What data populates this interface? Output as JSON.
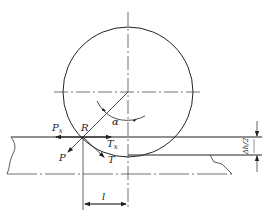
{
  "diagram": {
    "type": "rolling mill deformation zone force diagram",
    "labels": {
      "P_x_main": "P",
      "P_x_sub": "x",
      "R": "R",
      "alpha": "α",
      "T_x_main": "T",
      "T_x_sub": "x",
      "P": "P",
      "T": "T",
      "l": "l",
      "delta_h_over_2": "Δh/2"
    },
    "elements": [
      "roll-circle",
      "roll-centerlines",
      "strip-entry-surface",
      "strip-exit-surface",
      "strip-centerline",
      "force-arrows",
      "contact-length-dimension",
      "reduction-dimension"
    ],
    "colors": {
      "line": "#222222",
      "background": "#ffffff"
    }
  }
}
